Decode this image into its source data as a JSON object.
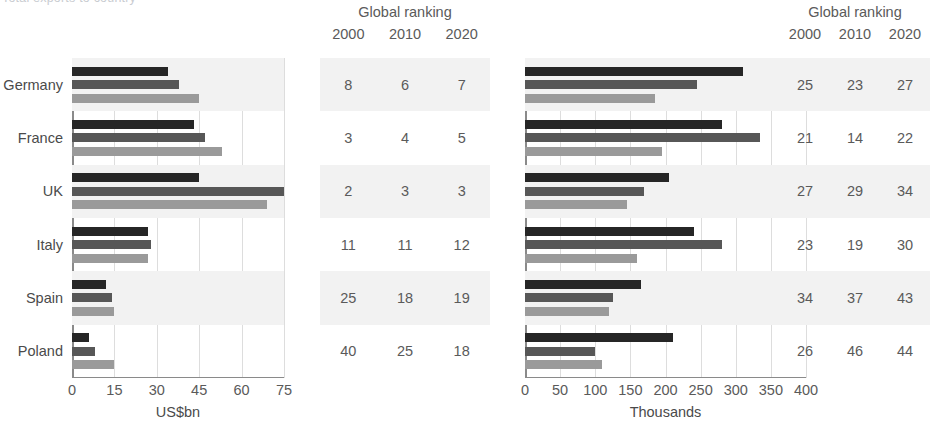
{
  "top_caption": "Total exports to country",
  "countries": [
    "Germany",
    "France",
    "UK",
    "Italy",
    "Spain",
    "Poland"
  ],
  "series_years": [
    "2000",
    "2010",
    "2020"
  ],
  "charts": [
    {
      "id": "left",
      "rank_header_title": "Global ranking",
      "rank_year_labels": [
        "2000",
        "2010",
        "2020"
      ],
      "axis_caption": "US$bn",
      "tick_labels": [
        "0",
        "15",
        "30",
        "45",
        "60",
        "75"
      ],
      "plot_left_px": 72,
      "plot_width_px": 212,
      "rank_left_px": 320,
      "rank_width_px": 170,
      "rankings": [
        [
          "8",
          "6",
          "7"
        ],
        [
          "3",
          "4",
          "5"
        ],
        [
          "2",
          "3",
          "3"
        ],
        [
          "11",
          "11",
          "12"
        ],
        [
          "25",
          "18",
          "19"
        ],
        [
          "40",
          "25",
          "18"
        ]
      ]
    },
    {
      "id": "right",
      "rank_header_title": "Global ranking",
      "rank_year_labels": [
        "2000",
        "2010",
        "2020"
      ],
      "axis_caption": "Thousands",
      "tick_labels": [
        "0",
        "50",
        "100",
        "150",
        "200",
        "250",
        "300",
        "350",
        "400"
      ],
      "plot_left_px": 25,
      "plot_width_px": 281,
      "rank_left_px": 280,
      "rank_width_px": 150,
      "rankings": [
        [
          "25",
          "23",
          "27"
        ],
        [
          "21",
          "14",
          "22"
        ],
        [
          "27",
          "29",
          "34"
        ],
        [
          "23",
          "19",
          "30"
        ],
        [
          "34",
          "37",
          "43"
        ],
        [
          "26",
          "46",
          "44"
        ]
      ]
    }
  ],
  "colors": {
    "series_2000": "#262626",
    "series_2010": "#575757",
    "series_2020": "#9a9a9a",
    "row_shade": "#f2f2f2",
    "gridline": "#dddddd",
    "axis": "#8a8a8a",
    "text": "#5a5a5a"
  },
  "chart_data": [
    {
      "type": "bar",
      "title": "Global ranking",
      "orientation": "horizontal",
      "xlabel": "US$bn",
      "ylabel": "",
      "xlim": [
        0,
        75
      ],
      "xticks": [
        0,
        15,
        30,
        45,
        60,
        75
      ],
      "grid": true,
      "legend": "none",
      "categories": [
        "Germany",
        "France",
        "UK",
        "Italy",
        "Spain",
        "Poland"
      ],
      "series": [
        {
          "name": "2000",
          "color": "#262626",
          "values": [
            34,
            43,
            45,
            27,
            12,
            6
          ]
        },
        {
          "name": "2010",
          "color": "#575757",
          "values": [
            38,
            47,
            75,
            28,
            14,
            8
          ]
        },
        {
          "name": "2020",
          "color": "#9a9a9a",
          "values": [
            45,
            53,
            69,
            27,
            15,
            15
          ]
        }
      ],
      "annotations": {
        "global_ranking": {
          "columns": [
            "2000",
            "2010",
            "2020"
          ],
          "rows": {
            "Germany": [
              8,
              6,
              7
            ],
            "France": [
              3,
              4,
              5
            ],
            "UK": [
              2,
              3,
              3
            ],
            "Italy": [
              11,
              11,
              12
            ],
            "Spain": [
              25,
              18,
              19
            ],
            "Poland": [
              40,
              25,
              18
            ]
          }
        }
      }
    },
    {
      "type": "bar",
      "title": "Global ranking",
      "orientation": "horizontal",
      "xlabel": "Thousands",
      "ylabel": "",
      "xlim": [
        0,
        400
      ],
      "xticks": [
        0,
        50,
        100,
        150,
        200,
        250,
        300,
        350,
        400
      ],
      "grid": true,
      "legend": "none",
      "categories": [
        "Germany",
        "France",
        "UK",
        "Italy",
        "Spain",
        "Poland"
      ],
      "series": [
        {
          "name": "2000",
          "color": "#262626",
          "values": [
            310,
            280,
            205,
            240,
            165,
            210
          ]
        },
        {
          "name": "2010",
          "color": "#575757",
          "values": [
            245,
            335,
            170,
            280,
            125,
            100
          ]
        },
        {
          "name": "2020",
          "color": "#9a9a9a",
          "values": [
            185,
            195,
            145,
            160,
            120,
            110
          ]
        }
      ],
      "annotations": {
        "global_ranking": {
          "columns": [
            "2000",
            "2010",
            "2020"
          ],
          "rows": {
            "Germany": [
              25,
              23,
              27
            ],
            "France": [
              21,
              14,
              22
            ],
            "UK": [
              27,
              29,
              34
            ],
            "Italy": [
              23,
              19,
              30
            ],
            "Spain": [
              34,
              37,
              43
            ],
            "Poland": [
              26,
              46,
              44
            ]
          }
        }
      }
    }
  ]
}
